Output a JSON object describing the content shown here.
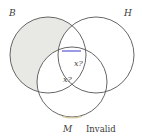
{
  "figure": {
    "type": "venn-diagram",
    "caption_verdict": "Invalid",
    "sets": [
      {
        "id": "B",
        "label": "B",
        "cx": 48,
        "cy": 55,
        "r": 38,
        "position": "top-left"
      },
      {
        "id": "H",
        "label": "H",
        "cx": 96,
        "cy": 55,
        "r": 38,
        "position": "top-right"
      },
      {
        "id": "M",
        "label": "M",
        "cx": 72,
        "cy": 82,
        "r": 35,
        "position": "bottom"
      }
    ],
    "shaded_region": {
      "description": "B only, excluding overlaps with H and M",
      "fill": "#e8e8e5"
    },
    "cell_markers": [
      {
        "text": "x?",
        "region": "B-and-H-and-M-boundary",
        "x": 74,
        "y": 60
      },
      {
        "text": "x?",
        "region": "B-and-M-not-H",
        "x": 63,
        "y": 76
      }
    ],
    "highlight_segment": {
      "description": "blue arc segment on B-H intersection boundary",
      "color": "#4a4ad0",
      "x1": 62,
      "y1": 51,
      "x2": 81,
      "y2": 51
    },
    "bottom_marker": {
      "description": "faint tan arc mark at bottom of M circle",
      "color": "#d8c9a0"
    },
    "stroke_color": "#555555",
    "background": "#ffffff"
  }
}
